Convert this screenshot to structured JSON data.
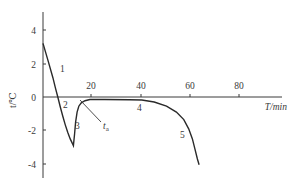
{
  "chart_data": {
    "type": "line",
    "title": "",
    "xlabel": "T/min",
    "ylabel": "t/℃",
    "xlim": [
      0,
      97
    ],
    "ylim": [
      -5,
      5
    ],
    "xticks": [
      20,
      40,
      60,
      80
    ],
    "xtick_labels": [
      "20",
      "40",
      "60",
      "80"
    ],
    "yticks": [
      4,
      2,
      0,
      -2,
      -4
    ],
    "ytick_labels": [
      "4",
      "2",
      "0",
      "-2",
      "-4"
    ],
    "grid": false,
    "legend": "none",
    "annotations": [
      {
        "text": "1",
        "x": 4.5,
        "y": 1.7,
        "note": "segment 1: rapid cooling from ~3.2 to 0"
      },
      {
        "text": "2",
        "x": 8.5,
        "y": -0.45,
        "note": "segment 2: supercooling below 0"
      },
      {
        "text": "3",
        "x": 14,
        "y": -1.9,
        "note": "segment 3: temperature rebound after nucleation"
      },
      {
        "text": "t_a",
        "x": 25,
        "y": -1.7,
        "note": "leader line pointing to the plateau start"
      },
      {
        "text": "4",
        "x": 38.5,
        "y": -0.65,
        "note": "segment 4: phase-change plateau"
      },
      {
        "text": "5",
        "x": 55,
        "y": -2.3,
        "note": "segment 5: final temperature drop"
      }
    ],
    "series": [
      {
        "name": "temperature curve",
        "points": [
          [
            0,
            3.2
          ],
          [
            2,
            2.2
          ],
          [
            4,
            1.15
          ],
          [
            5,
            0.55
          ],
          [
            6,
            0.0
          ],
          [
            7,
            -0.6
          ],
          [
            8,
            -1.15
          ],
          [
            9,
            -1.65
          ],
          [
            10,
            -2.1
          ],
          [
            11,
            -2.5
          ],
          [
            12,
            -2.8
          ],
          [
            12.3,
            -2.9
          ],
          [
            12.8,
            -2.2
          ],
          [
            13.2,
            -1.5
          ],
          [
            13.8,
            -0.9
          ],
          [
            14.5,
            -0.55
          ],
          [
            15.5,
            -0.35
          ],
          [
            17,
            -0.22
          ],
          [
            19,
            -0.15
          ],
          [
            25,
            -0.15
          ],
          [
            35,
            -0.16
          ],
          [
            40,
            -0.18
          ],
          [
            45,
            -0.3
          ],
          [
            50,
            -0.55
          ],
          [
            54,
            -0.9
          ],
          [
            57,
            -1.35
          ],
          [
            59,
            -1.9
          ],
          [
            60.5,
            -2.5
          ],
          [
            61.5,
            -3.1
          ],
          [
            62.5,
            -3.7
          ],
          [
            63.2,
            -4.05
          ]
        ]
      }
    ]
  }
}
